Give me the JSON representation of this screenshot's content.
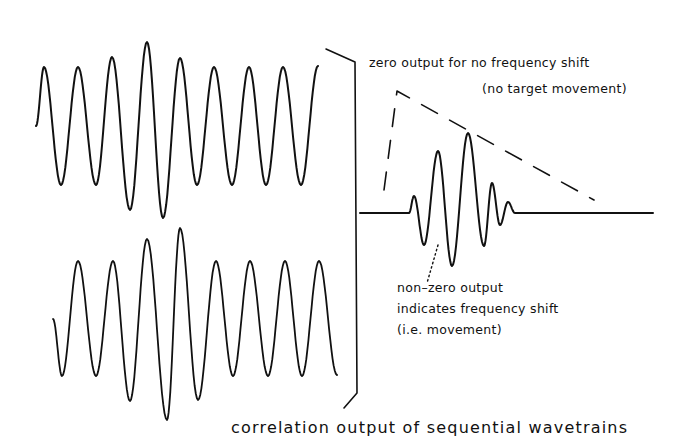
{
  "diagram": {
    "colors": {
      "ink": "#111111",
      "background": "#ffffff"
    },
    "waveforms": [
      {
        "id": "wavetrain-1",
        "description": "first sequential wavetrain (sinusoid with amplitude bulge near center)"
      },
      {
        "id": "wavetrain-2",
        "description": "second sequential wavetrain (sinusoid with amplitude bulge near center)"
      },
      {
        "id": "correlation-output",
        "description": "correlation result: short wavelet on flat baseline"
      }
    ],
    "labels": {
      "zero_output_line1": "zero output for no frequency shift",
      "zero_output_line2": "(no target movement)",
      "nonzero_line1": "non–zero output",
      "nonzero_line2": "indicates frequency shift",
      "nonzero_line3": "(i.e. movement)",
      "caption": "correlation output of sequential wavetrains"
    }
  }
}
